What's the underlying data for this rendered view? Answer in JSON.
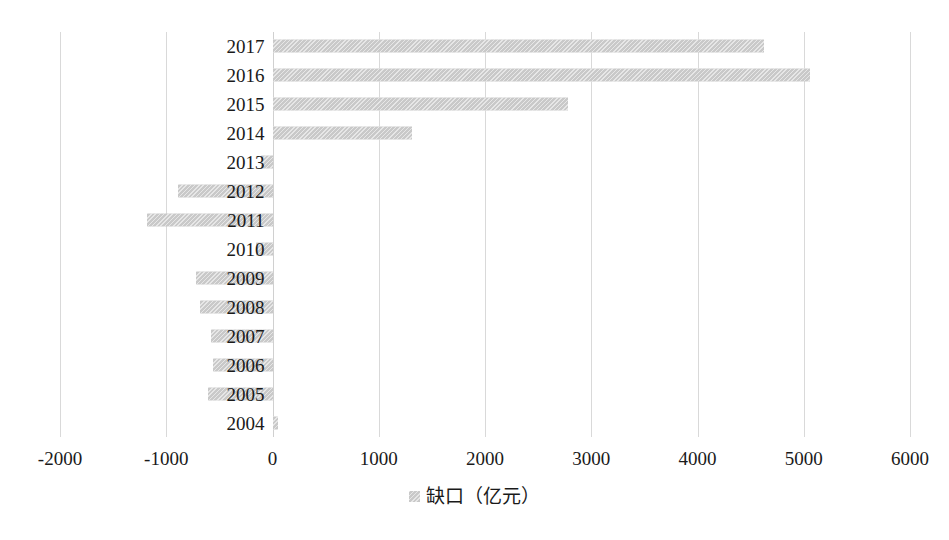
{
  "chart_data": {
    "type": "bar",
    "orientation": "horizontal",
    "title": "",
    "subtitle": "",
    "xlabel": "",
    "ylabel": "",
    "categories": [
      "2004",
      "2005",
      "2006",
      "2007",
      "2008",
      "2009",
      "2010",
      "2011",
      "2012",
      "2013",
      "2014",
      "2015",
      "2016",
      "2017"
    ],
    "series": [
      {
        "name": "缺口（亿元）",
        "values": [
          50,
          -610,
          -560,
          -580,
          -680,
          -720,
          -160,
          -1180,
          -890,
          -110,
          1310,
          2780,
          5060,
          4630
        ]
      }
    ],
    "xlim": [
      -2000,
      6000
    ],
    "xticks": [
      -2000,
      -1000,
      0,
      1000,
      2000,
      3000,
      4000,
      5000,
      6000
    ],
    "xtick_labels": [
      "-2000",
      "-1000",
      "0",
      "1000",
      "2000",
      "3000",
      "4000",
      "5000",
      "6000"
    ],
    "grid": "vertical",
    "legend": {
      "position": "bottom",
      "entries": [
        {
          "label": "缺口（亿元）",
          "color": "#c9c9c9",
          "marker": "square-swatch"
        }
      ]
    },
    "bar_color": "#c9c9c9",
    "gridline_color": "#d9d9d9",
    "background_color": "#ffffff",
    "axis_label_color": "#1a1a1a"
  }
}
